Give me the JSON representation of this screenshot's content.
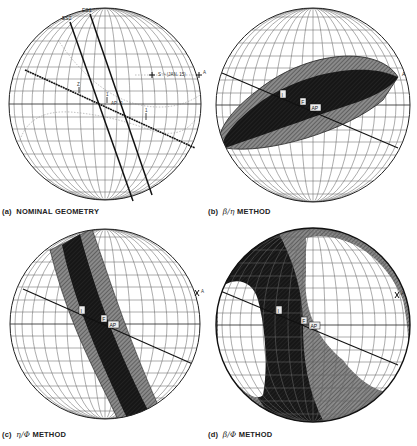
{
  "figure": {
    "panels": [
      {
        "id": "a",
        "caption_prefix": "(a)",
        "caption_text": "NOMINAL GEOMETRY",
        "labels": {
          "es1": "ES1",
          "es2": "ES2",
          "sun": "S⁻¹ (JAN. 15)",
          "a": "A",
          "ap": "AP",
          "tick1": "1",
          "tick2": "2",
          "tickZ": "Z"
        }
      },
      {
        "id": "b",
        "caption_prefix": "(b)",
        "caption_greek": "β/η",
        "caption_text": "METHOD",
        "labels": {
          "i": "I",
          "f": "F",
          "ap": "AP",
          "a": "A"
        }
      },
      {
        "id": "c",
        "caption_prefix": "(c)",
        "caption_greek": "η/Φ",
        "caption_text": "METHOD",
        "labels": {
          "i": "I",
          "f": "F",
          "ap": "AP",
          "a": "A"
        }
      },
      {
        "id": "d",
        "caption_prefix": "(d)",
        "caption_greek": "β/Φ",
        "caption_text": "METHOD",
        "labels": {
          "i": "I",
          "f": "F",
          "ap": "AP",
          "a": "A"
        }
      }
    ],
    "colors": {
      "grid": "#555555",
      "dark_region": "#111111",
      "hatched_region": "#7a7a7a",
      "line": "#1a1a1a"
    }
  }
}
